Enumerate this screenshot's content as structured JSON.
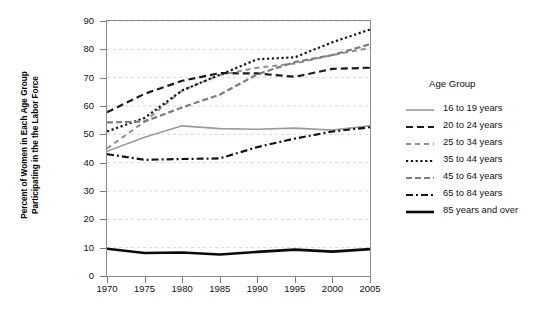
{
  "chart_data": {
    "type": "line",
    "title": "",
    "xlabel": "",
    "ylabel": "Percent of Women in Each Age Group Participating in the the Labor Force",
    "ylabel_line1": "Percent of Women in Each Age Group",
    "ylabel_line2": "Participating in the the Labor Force",
    "x": [
      1970,
      1975,
      1980,
      1985,
      1990,
      1995,
      2000,
      2005
    ],
    "xticks": [
      "1970",
      "1975",
      "1980",
      "1985",
      "1990",
      "1995",
      "2000",
      "2005"
    ],
    "yticks": [
      "0",
      "10",
      "20",
      "30",
      "40",
      "50",
      "60",
      "70",
      "80",
      "90"
    ],
    "xlim": [
      1970,
      2005
    ],
    "ylim": [
      0,
      90
    ],
    "grid": "horizontal-dashed",
    "legend_position": "right",
    "legend_title": "Age Group",
    "series": [
      {
        "name": "16 to 19 years",
        "style": "solid",
        "color": "#9a9a9a",
        "width": 1.6,
        "values": [
          44.0,
          49.0,
          53.0,
          52.0,
          51.8,
          52.2,
          51.5,
          53.0
        ]
      },
      {
        "name": "20 to 24 years",
        "style": "dashed",
        "color": "#1a1a1a",
        "width": 2.2,
        "values": [
          57.8,
          64.3,
          68.9,
          71.6,
          71.5,
          70.3,
          73.1,
          73.5
        ]
      },
      {
        "name": "25 to 34 years",
        "style": "dashed-short",
        "color": "#8f8f8f",
        "width": 2.0,
        "values": [
          45.0,
          54.5,
          65.5,
          70.9,
          73.5,
          75.0,
          78.0,
          80.5
        ]
      },
      {
        "name": "35 to 44 years",
        "style": "dotted",
        "color": "#141414",
        "width": 2.2,
        "values": [
          51.0,
          55.8,
          65.5,
          71.0,
          76.5,
          77.2,
          82.5,
          87.0
        ]
      },
      {
        "name": "45 to 64 years",
        "style": "dashed-medium",
        "color": "#7d7d7d",
        "width": 2.2,
        "values": [
          54.2,
          54.5,
          59.5,
          64.0,
          71.2,
          75.5,
          78.0,
          81.8
        ]
      },
      {
        "name": "65 to 84 years",
        "style": "dash-dot",
        "color": "#141414",
        "width": 2.2,
        "values": [
          43.0,
          41.0,
          41.3,
          41.5,
          45.5,
          48.5,
          51.0,
          52.5
        ]
      },
      {
        "name": "85 years and over",
        "style": "solid",
        "color": "#0b0b0b",
        "width": 2.6,
        "values": [
          9.6,
          8.1,
          8.3,
          7.6,
          8.5,
          9.3,
          8.6,
          9.5
        ]
      }
    ]
  }
}
